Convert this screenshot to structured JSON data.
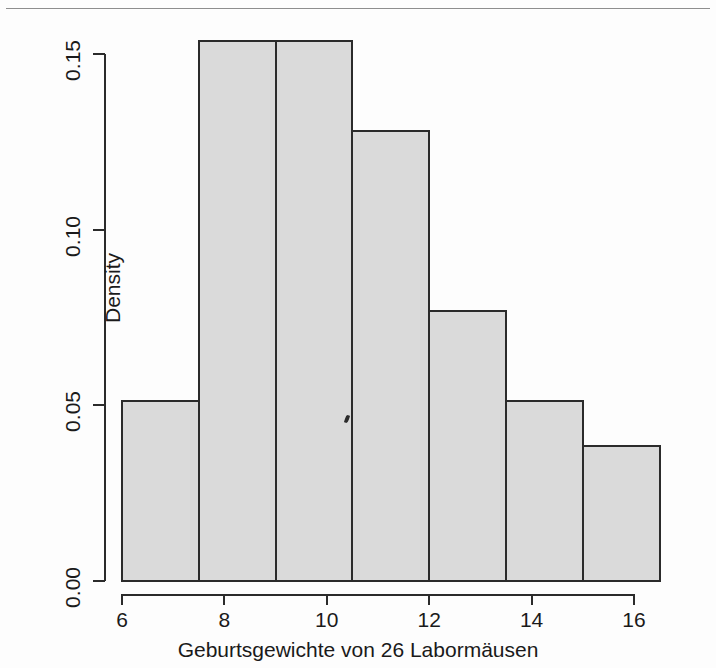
{
  "figure": {
    "kind": "histogram",
    "background_color": "#fdfdfd",
    "bar_fill_color": "#dadada",
    "bar_border_color": "#2b2b2b"
  },
  "axis": {
    "y_title": "Density",
    "x_title": "Geburtsgewichte von 26 Labormäusen",
    "y_ticks": [
      "0.00",
      "0.05",
      "0.10",
      "0.15"
    ],
    "x_ticks": [
      "6",
      "8",
      "10",
      "12",
      "14",
      "16"
    ]
  },
  "chart_data": {
    "type": "bar",
    "title": "",
    "subtitle": "",
    "xlabel": "Geburtsgewichte von 26 Labormäusen",
    "ylabel": "Density",
    "xlim": [
      6,
      16.5
    ],
    "ylim": [
      0.0,
      0.155
    ],
    "grid": false,
    "legend": false,
    "sample_size": 26,
    "bin_width": 1.5,
    "bin_edges": [
      6.0,
      7.5,
      9.0,
      10.5,
      12.0,
      13.5,
      15.0,
      16.5
    ],
    "categories": [
      "6–7.5",
      "7.5–9",
      "9–10.5",
      "10.5–12",
      "12–13.5",
      "13.5–15",
      "15–16.5"
    ],
    "values": [
      0.0513,
      0.1538,
      0.1538,
      0.1282,
      0.0769,
      0.0513,
      0.0385
    ],
    "counts": [
      2,
      6,
      6,
      5,
      3,
      2,
      1.5
    ],
    "x_tick_values": [
      6,
      8,
      10,
      12,
      14,
      16
    ],
    "y_tick_values": [
      0.0,
      0.05,
      0.1,
      0.15
    ]
  }
}
